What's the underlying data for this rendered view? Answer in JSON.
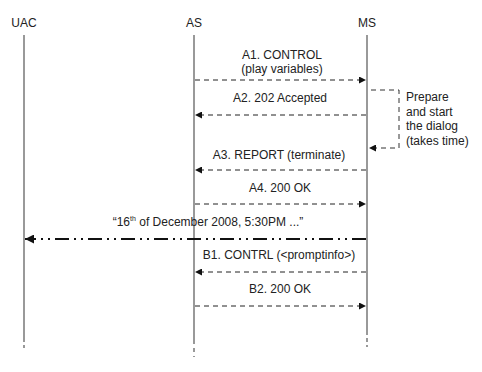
{
  "actors": [
    {
      "name": "UAC",
      "x": 24
    },
    {
      "name": "AS",
      "x": 194
    },
    {
      "name": "MS",
      "x": 367
    }
  ],
  "messages": [
    {
      "id": "A1",
      "line1": "A1. CONTROL",
      "line2": "(play variables)",
      "from": "AS",
      "to": "MS",
      "style": "dashed",
      "y": 80
    },
    {
      "id": "A2",
      "line1": "A2. 202 Accepted",
      "from": "MS",
      "to": "AS",
      "style": "dashed",
      "y": 115
    },
    {
      "id": "A3",
      "line1": "A3. REPORT (terminate)",
      "from": "MS",
      "to": "AS",
      "style": "dashed",
      "y": 170
    },
    {
      "id": "A4",
      "line1": "A4. 200 OK",
      "from": "AS",
      "to": "MS",
      "style": "dashed",
      "y": 204
    },
    {
      "id": "media",
      "prefix": "“16",
      "sup": "th",
      "suffix": " of December 2008, 5:30PM ...”",
      "from": "MS",
      "to": "UAC",
      "style": "dash-dot",
      "y": 239
    },
    {
      "id": "B1",
      "line1": "B1. CONTRL (<promptinfo>)",
      "from": "MS",
      "to": "AS",
      "style": "dashed",
      "y": 272
    },
    {
      "id": "B2",
      "line1": "B2. 200 OK",
      "from": "AS",
      "to": "MS",
      "style": "dashed",
      "y": 306
    }
  ],
  "self_note": {
    "lines": [
      "Prepare",
      "and start",
      "the dialog",
      "(takes time)"
    ]
  }
}
